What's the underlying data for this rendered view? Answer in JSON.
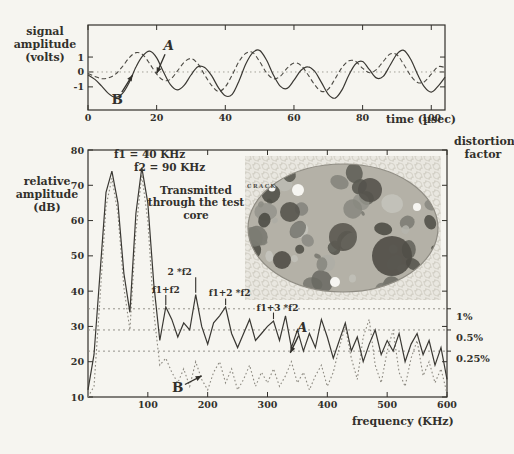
{
  "page": {
    "background": "#f6f5f0",
    "ink": "#32302b"
  },
  "chart_data": [
    {
      "id": "time-waveform",
      "type": "line",
      "xlabel": "time (µsec)",
      "ylabel": "signal amplitude (volts)",
      "xlim": [
        0,
        104
      ],
      "ylim": [
        -2.55,
        3.15
      ],
      "x_ticks": [
        0,
        20,
        40,
        60,
        80,
        100
      ],
      "y_ticks": [
        1,
        0,
        -1
      ],
      "zero_line": 0,
      "x_start": 0,
      "x_step": 2,
      "series": [
        {
          "name": "A",
          "style": "dashed",
          "values": [
            -0.1,
            -0.3,
            -0.45,
            -0.4,
            -0.15,
            0.35,
            0.95,
            1.3,
            1.15,
            0.55,
            -0.15,
            -0.55,
            -0.5,
            0.05,
            0.65,
            0.9,
            0.55,
            -0.2,
            -0.9,
            -1.3,
            -1.0,
            -0.2,
            0.7,
            1.25,
            1.3,
            0.7,
            -0.05,
            -0.45,
            -0.3,
            0.25,
            0.6,
            0.45,
            -0.15,
            -0.85,
            -1.3,
            -1.15,
            -0.45,
            0.3,
            0.75,
            0.7,
            0.25,
            -0.05,
            0.15,
            0.7,
            1.2,
            1.15,
            0.5,
            -0.25,
            -0.7,
            -0.65,
            -0.15,
            0.35,
            0.3
          ]
        },
        {
          "name": "B",
          "style": "solid",
          "values": [
            -0.2,
            -0.5,
            -0.95,
            -1.45,
            -1.7,
            -1.45,
            -0.7,
            0.35,
            1.1,
            1.4,
            0.95,
            0.0,
            -0.85,
            -1.2,
            -0.9,
            -0.2,
            0.35,
            0.3,
            -0.25,
            -1.05,
            -1.6,
            -1.5,
            -0.6,
            0.55,
            1.3,
            1.45,
            0.8,
            -0.2,
            -0.95,
            -1.1,
            -0.55,
            0.1,
            0.35,
            0.05,
            -0.7,
            -1.5,
            -1.75,
            -1.2,
            -0.2,
            0.55,
            0.7,
            0.15,
            -0.4,
            -0.3,
            0.45,
            1.2,
            1.45,
            0.85,
            -0.15,
            -1.0,
            -1.35,
            -0.95,
            -0.35
          ]
        }
      ],
      "annotations": [
        {
          "label": "A",
          "italic": true,
          "lx": 23.5,
          "ly": 1.75,
          "ex": 20,
          "ey": -0.1
        },
        {
          "label": "B",
          "italic": false,
          "lx": 8.5,
          "ly": -1.85,
          "ex": 13,
          "ey": -0.2
        }
      ]
    },
    {
      "id": "spectrum",
      "type": "line",
      "xlabel": "frequency (KHz)",
      "ylabel": "relative amplitude (dB)",
      "right_label": "distortion factor",
      "xlim": [
        0,
        600
      ],
      "ylim": [
        10,
        80
      ],
      "x_ticks": [
        100,
        200,
        300,
        400,
        500,
        600
      ],
      "y_ticks": [
        10,
        20,
        30,
        40,
        50,
        60,
        70,
        80
      ],
      "x_start": 0,
      "x_step": 10,
      "notes": {
        "f1": "f1 = 40 KHz",
        "f2": "f2 = 90 KHz",
        "transmitted": "Transmitted through the test core"
      },
      "series": [
        {
          "name": "A",
          "style": "solid",
          "values": [
            12,
            22,
            45,
            68,
            74,
            65,
            45,
            34,
            62,
            75,
            65,
            42,
            26,
            35.5,
            32,
            27,
            31,
            29,
            39,
            30,
            25,
            31,
            33,
            35.5,
            28,
            24,
            28,
            32,
            26,
            28,
            30,
            31.5,
            26,
            33,
            24,
            29,
            23,
            28,
            24,
            32,
            27,
            21,
            26,
            31,
            23,
            27,
            20,
            25,
            29,
            22,
            26,
            23,
            28,
            20,
            25,
            28,
            22,
            26,
            19,
            24,
            15
          ]
        },
        {
          "name": "B",
          "style": "dotted",
          "values": [
            10,
            13,
            38,
            64,
            72,
            62,
            41,
            29,
            57,
            73,
            60,
            34,
            19,
            21,
            17,
            14,
            18,
            13,
            20,
            15,
            12,
            17,
            20,
            14,
            18,
            12,
            15,
            19,
            13,
            17,
            14,
            18,
            13,
            16,
            20,
            14,
            17,
            12,
            16,
            19,
            13,
            17,
            24,
            30,
            21,
            15,
            27,
            32,
            19,
            14,
            23,
            29,
            17,
            13,
            21,
            26,
            16,
            20,
            14,
            18,
            11
          ]
        }
      ],
      "peak_labels": [
        {
          "label": "f1+f2",
          "f": 130,
          "text_db": 39.5,
          "peak_db": 35.5,
          "dx": 0
        },
        {
          "label": "2 *f2",
          "f": 180,
          "text_db": 44.5,
          "peak_db": 39,
          "dx": -16
        },
        {
          "label": "f1+2 *f2",
          "f": 230,
          "text_db": 38.5,
          "peak_db": 35.5,
          "dx": 4
        },
        {
          "label": "f1+3 *f2",
          "f": 310,
          "text_db": 34.5,
          "peak_db": 31.5,
          "dx": 4
        }
      ],
      "distortion_levels": [
        {
          "label": "1%",
          "db": 35
        },
        {
          "label": "0.5%",
          "db": 29
        },
        {
          "label": "0.25%",
          "db": 23
        }
      ],
      "annotations": [
        {
          "label": "A",
          "italic": true,
          "lx": 358,
          "ldb": 29.5,
          "ex": 338,
          "edb": 22.5
        },
        {
          "label": "B",
          "italic": false,
          "lx": 150,
          "ldb": 12.5,
          "ex": 190,
          "edb": 16
        }
      ]
    }
  ],
  "inset": {
    "description": "photo of concrete test core cross-section",
    "crack_label": "CRACK"
  }
}
